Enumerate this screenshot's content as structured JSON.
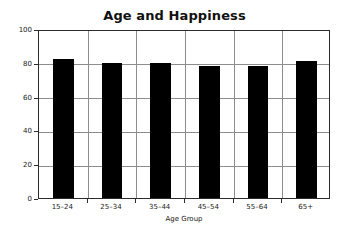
{
  "chart_data": {
    "type": "bar",
    "title": "Age and Happiness",
    "xlabel": "Age Group",
    "ylabel": "",
    "categories": [
      "15–24",
      "25–34",
      "35–44",
      "45–54",
      "55–64",
      "65+"
    ],
    "values": [
      82,
      80,
      80,
      78,
      78,
      81
    ],
    "ylim": [
      0,
      100
    ],
    "yticks": [
      0,
      20,
      40,
      60,
      80,
      100
    ],
    "ytick_labels": [
      "0",
      "20",
      "40",
      "60",
      "80",
      "100"
    ],
    "grid": "horizontal-and-vertical",
    "legend": "none",
    "bar_color": "#000000",
    "grid_color": "#8d8d8d",
    "axis_color": "#2b2b2b",
    "background_color": "#ffffff"
  }
}
